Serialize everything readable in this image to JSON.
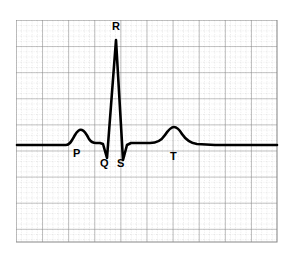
{
  "figure": {
    "width": 295,
    "height": 258,
    "background_color": "#ffffff"
  },
  "grid": {
    "x_start": 16,
    "y_start": 20,
    "x_end": 277,
    "y_end": 242,
    "major_spacing": 26.1,
    "minor_divisions": 5,
    "major_color": "#808080",
    "minor_color": "#b8b8b8",
    "minor_style": "dotted"
  },
  "trace": {
    "color": "#000000",
    "line_width": 2.6,
    "baseline_y": 145,
    "x_start": 17,
    "x_end": 277,
    "path": "M 17,145 L 66,145 C 70,145 72,140 75,135 C 78,130 80,129 82,130 C 85,131 87,135 89,139 C 91,142 93,143 96,143 L 100,143 L 103,144 L 107,158 L 116,40 L 123,160 L 127,145 L 131,143 L 150,143 C 157,143 161,141 165,135 C 169,129 171,127 174,127 C 177,127 179,129 182,134 C 186,140 190,143 197,144 L 215,145 L 277,145"
  },
  "chart_data": {
    "type": "line",
    "xlabel": "",
    "ylabel": "",
    "grid": true,
    "legend": "none",
    "series": [
      {
        "name": "ECG trace",
        "points": [
          {
            "x": 17,
            "y": 145,
            "feature": "isoelectric-baseline-start"
          },
          {
            "x": 66,
            "y": 145,
            "feature": "P-wave-onset"
          },
          {
            "x": 82,
            "y": 130,
            "feature": "P-wave-peak"
          },
          {
            "x": 96,
            "y": 143,
            "feature": "P-wave-offset"
          },
          {
            "x": 103,
            "y": 144,
            "feature": "PR-segment"
          },
          {
            "x": 107,
            "y": 158,
            "feature": "Q-trough"
          },
          {
            "x": 116,
            "y": 40,
            "feature": "R-peak"
          },
          {
            "x": 123,
            "y": 160,
            "feature": "S-trough"
          },
          {
            "x": 131,
            "y": 143,
            "feature": "J-point"
          },
          {
            "x": 150,
            "y": 143,
            "feature": "ST-segment"
          },
          {
            "x": 174,
            "y": 127,
            "feature": "T-wave-peak"
          },
          {
            "x": 197,
            "y": 144,
            "feature": "T-wave-offset"
          },
          {
            "x": 277,
            "y": 145,
            "feature": "isoelectric-baseline-end"
          }
        ]
      }
    ],
    "annotations": [
      {
        "label": "P",
        "x": 74,
        "y": 153,
        "describes": "P wave (atrial depolarization)"
      },
      {
        "label": "Q",
        "x": 101,
        "y": 163,
        "describes": "Q wave (QRS initial downward deflection)"
      },
      {
        "label": "R",
        "x": 113,
        "y": 25,
        "describes": "R wave (QRS tall upward spike)"
      },
      {
        "label": "S",
        "x": 117,
        "y": 163,
        "describes": "S wave (QRS terminal downward deflection)"
      },
      {
        "label": "T",
        "x": 170,
        "y": 155,
        "describes": "T wave (ventricular repolarization)"
      }
    ]
  },
  "labels": {
    "p": "P",
    "q": "Q",
    "r": "R",
    "s": "S",
    "t": "T"
  }
}
